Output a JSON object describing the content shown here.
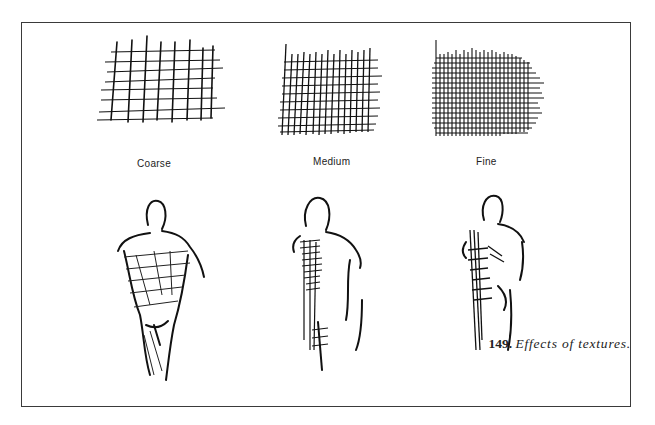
{
  "figure": {
    "swatches": [
      {
        "label": "Coarse"
      },
      {
        "label": "Medium"
      },
      {
        "label": "Fine"
      }
    ],
    "caption": {
      "number": "149.",
      "text": "Effects of textures."
    }
  }
}
